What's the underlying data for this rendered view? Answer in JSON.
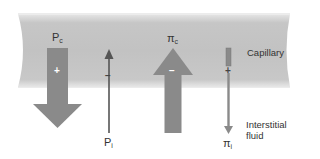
{
  "diagram": {
    "type": "starling-forces",
    "regions": {
      "capillary": {
        "label": "Capillary"
      },
      "interstitial": {
        "label_line1": "Interstitial",
        "label_line2": "fluid"
      }
    },
    "forces": [
      {
        "id": "Pc",
        "symbol": "P",
        "subscript": "c",
        "sign": "+",
        "direction": "down",
        "magnitude": "large"
      },
      {
        "id": "Pi",
        "symbol": "P",
        "subscript": "i",
        "sign": "−",
        "direction": "up",
        "magnitude": "small"
      },
      {
        "id": "pic",
        "symbol": "π",
        "subscript": "c",
        "sign": "−",
        "direction": "up",
        "magnitude": "large"
      },
      {
        "id": "pii",
        "symbol": "π",
        "subscript": "i",
        "sign": "+",
        "direction": "down",
        "magnitude": "small"
      }
    ],
    "colors": {
      "capillary_fill": "#c4c4c4",
      "capillary_edge": "#e2e2e2",
      "arrow_fill": "#8a8a8a",
      "thin_arrow": "#555555",
      "sign_color": "#ffffff",
      "text": "#333333"
    }
  }
}
